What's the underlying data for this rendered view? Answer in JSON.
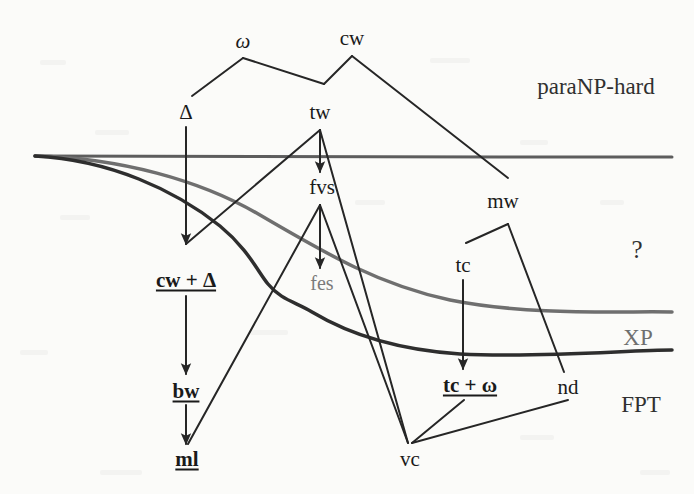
{
  "figure": {
    "type": "hierarchy-diagram",
    "title": "",
    "background_color": "#fbfbf9",
    "width": 694,
    "height": 494
  },
  "colors": {
    "ink": "#1a1a1a",
    "gray_ink": "#7b7b7b",
    "curve_top": "#5d5d5d",
    "curve_mid": "#6b6b6b",
    "curve_bottom": "#2e2e2e",
    "edge": "#262626"
  },
  "region_labels": [
    {
      "id": "paranp",
      "text": "paraNP-hard",
      "x": 596,
      "y": 86,
      "size": 23,
      "style": "plain"
    },
    {
      "id": "unknown",
      "text": "?",
      "x": 637,
      "y": 249,
      "size": 25,
      "style": "plain"
    },
    {
      "id": "xp",
      "text": "XP",
      "x": 638,
      "y": 337,
      "size": 23,
      "style": "gray"
    },
    {
      "id": "fpt",
      "text": "FPT",
      "x": 641,
      "y": 404,
      "size": 23,
      "style": "plain"
    }
  ],
  "nodes": [
    {
      "id": "omega",
      "text": "ω",
      "x": 243,
      "y": 41,
      "size": 21,
      "style": "italic-greek"
    },
    {
      "id": "cw",
      "text": "cw",
      "x": 352,
      "y": 38,
      "size": 21,
      "style": "plain"
    },
    {
      "id": "delta",
      "text": "Δ",
      "x": 186,
      "y": 112,
      "size": 21,
      "style": "plain"
    },
    {
      "id": "tw",
      "text": "tw",
      "x": 320,
      "y": 112,
      "size": 21,
      "style": "plain"
    },
    {
      "id": "fvs",
      "text": "fvs",
      "x": 322,
      "y": 187,
      "size": 21,
      "style": "plain"
    },
    {
      "id": "mw",
      "text": "mw",
      "x": 503,
      "y": 201,
      "size": 21,
      "style": "plain"
    },
    {
      "id": "tc",
      "text": "tc",
      "x": 463,
      "y": 265,
      "size": 21,
      "style": "plain"
    },
    {
      "id": "cwdelta",
      "text": "cw + Δ",
      "x": 186,
      "y": 280,
      "size": 21,
      "style": "bold-underline"
    },
    {
      "id": "fes",
      "text": "fes",
      "x": 322,
      "y": 283,
      "size": 20,
      "style": "gray"
    },
    {
      "id": "bw",
      "text": "bw",
      "x": 186,
      "y": 391,
      "size": 21,
      "style": "bold-underline"
    },
    {
      "id": "tcomega",
      "text": "tc + ω",
      "x": 470,
      "y": 385,
      "size": 21,
      "style": "bold-underline"
    },
    {
      "id": "nd",
      "text": "nd",
      "x": 568,
      "y": 387,
      "size": 21,
      "style": "plain"
    },
    {
      "id": "ml",
      "text": "ml",
      "x": 187,
      "y": 459,
      "size": 21,
      "style": "bold-underline"
    },
    {
      "id": "vc",
      "text": "vc",
      "x": 410,
      "y": 459,
      "size": 21,
      "style": "plain"
    }
  ],
  "edges": [
    {
      "id": "omega-delta",
      "from": "omega",
      "to": "delta",
      "points": "243,58 192,96"
    },
    {
      "id": "omega-tw",
      "from": "omega",
      "to": "tw",
      "points": "243,58 324,84"
    },
    {
      "id": "cw-tw",
      "from": "cw",
      "to": "tw",
      "points": "352,56 324,84"
    },
    {
      "id": "cw-mw",
      "from": "cw",
      "to": "mw",
      "points": "352,56 508,178"
    },
    {
      "id": "delta-cwdelta",
      "from": "delta",
      "to": "cwdelta",
      "points": "186,127 186,244",
      "arrow": true
    },
    {
      "id": "tw-cwdelta",
      "from": "tw",
      "to": "cwdelta",
      "points": "320,130 186,244"
    },
    {
      "id": "tw-vc",
      "from": "tw",
      "to": "vc",
      "points": "320,130 408,443"
    },
    {
      "id": "tw-fvs",
      "from": "tw",
      "to": "fvs",
      "points": "320,130 320,172",
      "arrow": true
    },
    {
      "id": "fvs-ml",
      "from": "fvs",
      "to": "ml",
      "points": "320,205 188,444"
    },
    {
      "id": "fvs-vc",
      "from": "fvs",
      "to": "vc",
      "points": "320,205 408,443"
    },
    {
      "id": "fvs-fes",
      "from": "fvs",
      "to": "fes",
      "points": "320,205 320,268",
      "arrow": true
    },
    {
      "id": "mw-tc",
      "from": "mw",
      "to": "tc",
      "points": "508,224 466,243"
    },
    {
      "id": "mw-nd",
      "from": "mw",
      "to": "nd",
      "points": "508,224 564,372"
    },
    {
      "id": "tc-tcomega",
      "from": "tc",
      "to": "tcomega",
      "points": "463,280 463,369",
      "arrow": true
    },
    {
      "id": "cwdelta-bw",
      "from": "cwdelta",
      "to": "bw",
      "points": "186,296 186,374",
      "arrow": true
    },
    {
      "id": "bw-ml",
      "from": "bw",
      "to": "ml",
      "points": "186,405 186,444",
      "arrow": true
    },
    {
      "id": "tcomega-vc",
      "from": "tcomega",
      "to": "vc",
      "points": "464,400 412,443"
    },
    {
      "id": "nd-vc",
      "from": "nd",
      "to": "vc",
      "points": "568,400 412,443"
    }
  ],
  "boundary_curves": [
    {
      "id": "paranp-xp-boundary",
      "name": "upper-boundary",
      "color": "#5d5d5d",
      "width": 3,
      "path": "M 35,156 C 120,156 300,157 500,157 C 580,157 640,157 672,157"
    },
    {
      "id": "xp-upper-curve",
      "name": "xp-upper-boundary",
      "color": "#6f6f6f",
      "width": 3.5,
      "path": "M 35,156 C 120,158 200,180 260,215 C 330,256 380,285 450,300 C 530,316 620,311 672,312"
    },
    {
      "id": "fpt-boundary",
      "name": "lower-boundary",
      "color": "#2e2e2e",
      "width": 3.5,
      "path": "M 35,156 C 110,160 175,190 220,226 C 248,249 258,272 268,284 C 281,300 296,302 312,312 C 352,336 400,350 460,354 C 540,358 630,350 672,350"
    }
  ],
  "legend": {
    "node_styles": {
      "bold-underline": "FPT / tractable parameter (bold, underlined)",
      "plain": "standard parameter",
      "gray": "greyed parameter"
    }
  }
}
